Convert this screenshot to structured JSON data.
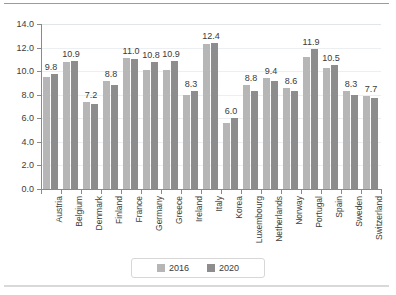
{
  "chart_data": {
    "type": "bar",
    "title": "",
    "xlabel": "",
    "ylabel": "",
    "ylim": [
      0.0,
      14.0
    ],
    "ytick_labels": [
      "14.0",
      "12.0",
      "10.0",
      "8.0",
      "6.0",
      "4.0",
      "2.0",
      "0.0"
    ],
    "ytick_values": [
      14.0,
      12.0,
      10.0,
      8.0,
      6.0,
      4.0,
      2.0,
      0.0
    ],
    "grid": true,
    "legend_position": "bottom",
    "categories": [
      "Austria",
      "Belgium",
      "Denmark",
      "Finland",
      "France",
      "Germany",
      "Greece",
      "Ireland",
      "Italy",
      "Korea",
      "Luxembourg",
      "Netherlands",
      "Norway",
      "Portugal",
      "Spain",
      "Sweden",
      "Switzerland"
    ],
    "series": [
      {
        "name": "2016",
        "color": "#b6b6b6",
        "values": [
          9.5,
          10.8,
          7.4,
          9.2,
          11.1,
          10.1,
          10.1,
          8.0,
          12.3,
          5.6,
          8.8,
          9.4,
          8.6,
          11.2,
          10.3,
          8.3,
          7.9
        ]
      },
      {
        "name": "2020",
        "color": "#8d8d8d",
        "values": [
          9.8,
          10.9,
          7.2,
          8.8,
          11.0,
          10.8,
          10.9,
          8.3,
          12.4,
          6.0,
          8.3,
          9.2,
          8.3,
          11.9,
          10.5,
          8.0,
          7.7
        ]
      }
    ],
    "data_labels": {
      "series": "2020",
      "values": [
        "9.8",
        "10.9",
        "7.2",
        "8.8",
        "11.0",
        "10.8",
        "10.9",
        "8.3",
        "12.4",
        "6.0",
        "8.8",
        "9.4",
        "8.6",
        "11.9",
        "10.5",
        "8.3",
        "7.7"
      ]
    }
  },
  "legend": {
    "items": [
      {
        "label": "2016",
        "color": "#b6b6b6"
      },
      {
        "label": "2020",
        "color": "#8d8d8d"
      }
    ]
  }
}
